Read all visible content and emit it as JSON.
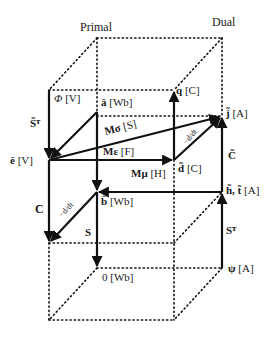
{
  "headers": {
    "primal": "Primal",
    "dual": "Dual"
  },
  "nodes": {
    "phi": {
      "sym": "Φ",
      "unit": "[V]"
    },
    "a": {
      "sym": "â",
      "unit": "[Wb]"
    },
    "q": {
      "sym": "q",
      "unit": "[C]"
    },
    "j": {
      "sym": "j̃",
      "unit": "[A]"
    },
    "e": {
      "sym": "ê",
      "unit": "[V]"
    },
    "d": {
      "sym": "d̃",
      "unit": "[C]"
    },
    "b": {
      "sym": "b̂",
      "unit": "[Wb]"
    },
    "h": {
      "sym": "h̃, t̃",
      "unit": "[A]"
    },
    "zero": {
      "sym": "0",
      "unit": "[Wb]"
    },
    "psi": {
      "sym": "ψ",
      "unit": "[A]"
    }
  },
  "operators": {
    "StT": "S̃ᵀ",
    "Msigma": "Mσ",
    "Msigma_unit": "[S]",
    "Meps": "Mε",
    "Meps_unit": "[F]",
    "Mmu": "Mμ",
    "Mmu_unit": "[H]",
    "C": "C",
    "S": "S",
    "Ct": "C̃",
    "ST": "Sᵀ",
    "ddt": "−d/dt"
  },
  "colors": {
    "line": "#111111",
    "text": "#1a1a1a"
  }
}
